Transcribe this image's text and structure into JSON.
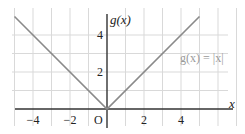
{
  "chart_data": {
    "type": "line",
    "title": "",
    "xlabel": "x",
    "ylabel": "g(x)",
    "origin_label": "O",
    "xlim": [
      -5,
      6
    ],
    "ylim": [
      0,
      5
    ],
    "grid": true,
    "x_ticks": [
      -4,
      -2,
      2,
      4
    ],
    "x_tick_labels": [
      "−4",
      "−2",
      "2",
      "4"
    ],
    "y_ticks": [
      2,
      4
    ],
    "y_tick_labels": [
      "2",
      "4"
    ],
    "series": [
      {
        "name": "g(x) = |x|",
        "color": "#8a8a8a",
        "x": [
          -5,
          0,
          5
        ],
        "y": [
          5,
          0,
          5
        ]
      }
    ],
    "annotations": [
      {
        "text": "g(x)  =  |x|",
        "x": 4.2,
        "y": 3,
        "placement": "right of curve"
      }
    ]
  }
}
